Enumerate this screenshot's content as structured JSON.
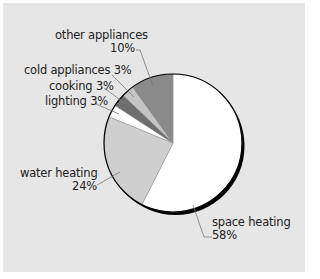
{
  "chart_data": {
    "type": "pie",
    "title": "",
    "start_angle_deg": 0,
    "direction": "clockwise",
    "slices": [
      {
        "label": "space heating",
        "value": 58,
        "display": "58%",
        "color": "#ffffff"
      },
      {
        "label": "water heating",
        "value": 24,
        "display": "24%",
        "color": "#cfcfcf"
      },
      {
        "label": "lighting",
        "value": 3,
        "display": "3%",
        "color": "#ffffff"
      },
      {
        "label": "cooking",
        "value": 3,
        "display": "3%",
        "color": "#6e6e6e"
      },
      {
        "label": "cold appliances",
        "value": 3,
        "display": "3%",
        "color": "#c4c4c4"
      },
      {
        "label": "other appliances",
        "value": 10,
        "display": "10%",
        "color": "#8a8a8a"
      }
    ],
    "legend": "none (direct labels with leader lines)"
  },
  "labels": {
    "other_appliances": {
      "name": "other appliances",
      "pct": "10%"
    },
    "cold_appliances": "cold appliances 3%",
    "cooking": "cooking 3%",
    "lighting": "lighting 3%",
    "water_heating": {
      "name": "water heating",
      "pct": "24%"
    },
    "space_heating": {
      "name": "space heating",
      "pct": "58%"
    }
  },
  "colors": {
    "background": "#e6e6e6",
    "outline": "#000000",
    "leader": "#777777"
  }
}
